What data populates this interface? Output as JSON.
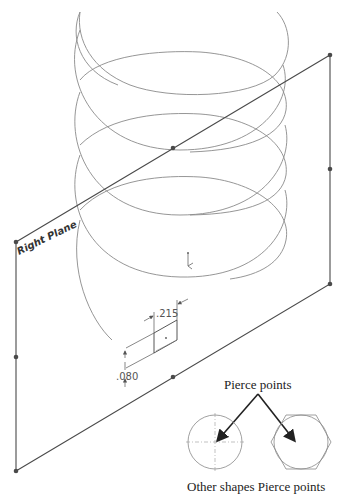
{
  "figure": {
    "plane_label": "Right Plane",
    "dimensions": {
      "width_label": ".215",
      "height_label": ".080"
    },
    "callout": {
      "title": "Pierce points",
      "caption": "Other shapes Pierce points"
    },
    "shapes": [
      "circle",
      "hexagon"
    ],
    "colors": {
      "helix": "#8a8a8a",
      "plane_edge": "#4a4a4a",
      "arrow": "#222222"
    }
  }
}
